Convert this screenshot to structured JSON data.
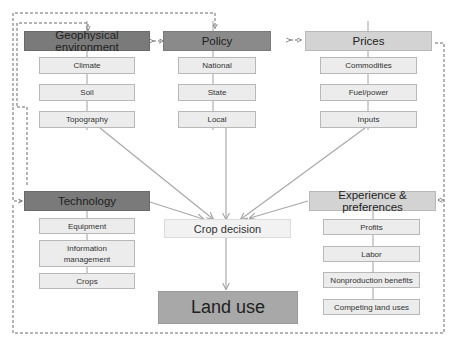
{
  "diagram": {
    "nodes": {
      "geophysical": {
        "label": "Geophysical environment",
        "children": [
          "Climate",
          "Soil",
          "Topography"
        ]
      },
      "policy": {
        "label": "Policy",
        "children": [
          "National",
          "State",
          "Local"
        ]
      },
      "prices": {
        "label": "Prices",
        "children": [
          "Commodities",
          "Fuel/power",
          "Inputs"
        ]
      },
      "technology": {
        "label": "Technology",
        "children": [
          "Equipment",
          "Information management",
          "Crops"
        ]
      },
      "experience": {
        "label": "Experience & preferences",
        "children": [
          "Profits",
          "Labor",
          "Nonproduction benefits",
          "Competing land uses"
        ]
      },
      "crop_decision": {
        "label": "Crop decision"
      },
      "land_use": {
        "label": "Land use"
      }
    },
    "edges": [
      {
        "from": "Topography",
        "to": "Crop decision",
        "style": "solid-arrow"
      },
      {
        "from": "Local",
        "to": "Crop decision",
        "style": "solid-arrow"
      },
      {
        "from": "Inputs",
        "to": "Crop decision",
        "style": "solid-arrow"
      },
      {
        "from": "Technology",
        "to": "Crop decision",
        "style": "solid-arrow"
      },
      {
        "from": "Experience & preferences",
        "to": "Crop decision",
        "style": "solid-arrow"
      },
      {
        "from": "Crop decision",
        "to": "Land use",
        "style": "solid-arrow"
      },
      {
        "from": "Geophysical environment",
        "to": "Policy",
        "style": "dashed-bidirectional"
      },
      {
        "from": "Policy",
        "to": "Prices",
        "style": "dashed-bidirectional"
      },
      {
        "from": "Land use",
        "to": "all factors",
        "style": "dashed-feedback"
      }
    ],
    "colors": {
      "dark_header": "#7a7a7a",
      "mid_header": "#8a8a8a",
      "light_header": "#d3d3d3",
      "sub_box": "#ececec",
      "crop_box": "#f2f2f2",
      "land_box": "#a8a8a8",
      "arrow": "#a0a0a0",
      "dashed": "#707070"
    }
  }
}
